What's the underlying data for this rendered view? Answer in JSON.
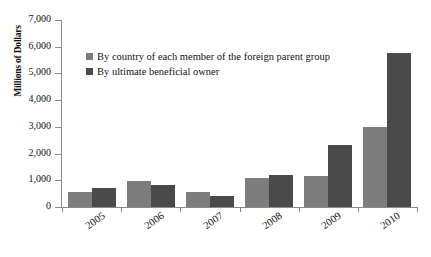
{
  "chart_data": {
    "type": "bar",
    "title": "",
    "subtitle": "",
    "xlabel": "",
    "ylabel": "Millions of Dollars",
    "categories": [
      "2005",
      "2006",
      "2007",
      "2008",
      "2009",
      "2010"
    ],
    "series": [
      {
        "name": "By country of each member of the foreign parent group",
        "color": "#7d7d7d",
        "values": [
          580,
          960,
          550,
          1090,
          1150,
          2990
        ]
      },
      {
        "name": "By ultimate beneficial owner",
        "color": "#4a4a4a",
        "values": [
          700,
          810,
          430,
          1190,
          2330,
          5780
        ]
      }
    ],
    "ylim": [
      0,
      7000
    ],
    "ytick_values": [
      0,
      1000,
      2000,
      3000,
      4000,
      5000,
      6000,
      7000
    ],
    "ytick_labels": [
      "0",
      "1,000",
      "2,000",
      "3,000",
      "4,000",
      "5,000",
      "6,000",
      "7,000"
    ],
    "grid": false,
    "legend_position": "upper-left-inside",
    "xtick_rotation": -35
  }
}
